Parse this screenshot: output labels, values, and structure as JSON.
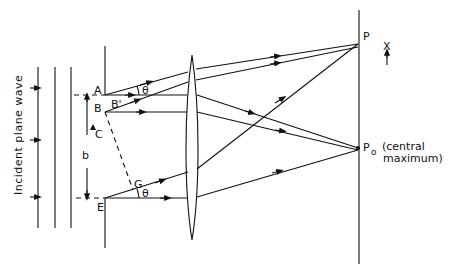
{
  "diagram": {
    "incident_label": "Incident plane wave",
    "points": {
      "A": "A",
      "B": "B",
      "B_prime": "B'",
      "C": "C",
      "E": "E",
      "G": "G",
      "P": "P",
      "P0": "P",
      "P0_sub": "o",
      "X": "X"
    },
    "angle_label": "θ",
    "width_label": "b",
    "central_max_line1": "(central",
    "central_max_line2": "maximum)"
  }
}
